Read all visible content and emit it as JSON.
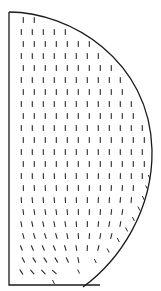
{
  "figure": {
    "type": "vector-field-plot",
    "colors": {
      "line": "#1a1a1a",
      "background": "#ffffff"
    }
  }
}
